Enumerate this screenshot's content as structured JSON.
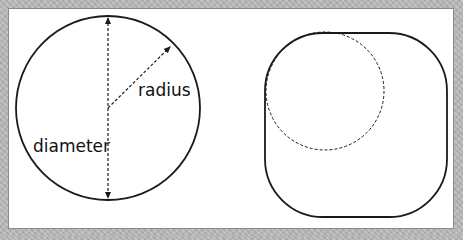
{
  "figure": {
    "left_diagram": {
      "shape": "circle",
      "labels": {
        "radius": "radius",
        "diameter": "diameter"
      },
      "stroke_color": "#1a1a1a"
    },
    "right_diagram": {
      "shape": "rounded-square",
      "inscribed_corner_circle": "dashed",
      "stroke_color": "#1a1a1a"
    },
    "background_color": "#ffffff",
    "frame_color": "#b9b9b9"
  }
}
